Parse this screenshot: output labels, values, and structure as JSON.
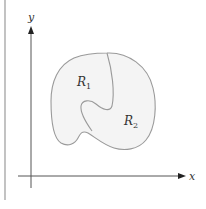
{
  "figure": {
    "axes": {
      "x_label": "x",
      "y_label": "y"
    },
    "regions": [
      {
        "name": "R",
        "subscript": "1"
      },
      {
        "name": "R",
        "subscript": "2"
      }
    ],
    "colors": {
      "axis": "#444444",
      "region_fill": "#f4f4f4",
      "region_stroke": "#9a9a9a",
      "border": "#9a9a9a",
      "text": "#333333"
    }
  }
}
